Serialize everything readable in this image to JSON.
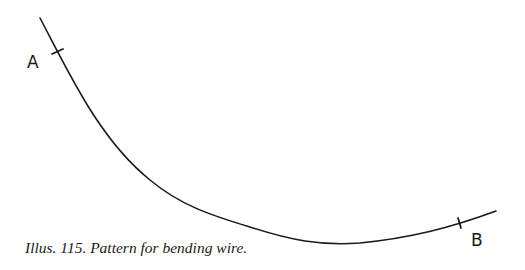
{
  "figure": {
    "caption": "Illus. 115. Pattern for bending wire.",
    "labels": {
      "a": "A",
      "b": "B"
    },
    "colors": {
      "background": "#ffffff",
      "line": "#1a1a1a"
    }
  }
}
